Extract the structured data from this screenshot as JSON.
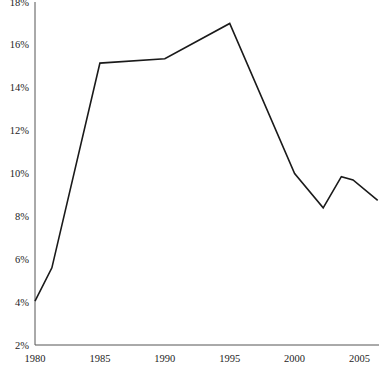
{
  "chart_data": {
    "type": "line",
    "title": "",
    "subtitle": "",
    "xlabel": "",
    "ylabel": "",
    "xlim": [
      1980,
      2006.5
    ],
    "ylim": [
      2,
      18
    ],
    "grid": false,
    "legend": null,
    "x_tick_labels": [
      "1980",
      "1985",
      "1990",
      "1995",
      "2000",
      "2005"
    ],
    "x_ticks": [
      1980,
      1985,
      1990,
      1995,
      2000,
      2005
    ],
    "y_tick_labels": [
      "2%",
      "4%",
      "6%",
      "8%",
      "10%",
      "12%",
      "14%",
      "16%",
      "18%"
    ],
    "y_ticks": [
      2,
      4,
      6,
      8,
      10,
      12,
      14,
      16,
      18
    ],
    "series": [
      {
        "name": "series-1",
        "color": "#1a1a1a",
        "line_width": 1.6,
        "x": [
          1980,
          1981.3,
          1985,
          1990,
          1995,
          2000,
          2002.2,
          2003.6,
          2004.5,
          2006.4
        ],
        "values": [
          4.05,
          5.6,
          15.15,
          15.35,
          17.0,
          10.0,
          8.4,
          9.85,
          9.7,
          8.75
        ]
      }
    ],
    "axis_color": "#555555",
    "background": "#ffffff"
  },
  "layout": {
    "plot_left": 35,
    "plot_right": 379,
    "plot_top": 2,
    "plot_bottom": 345,
    "width": 381,
    "height": 378
  }
}
